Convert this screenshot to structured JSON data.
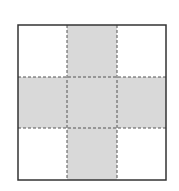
{
  "diagram": {
    "type": "3x3 grid cross pattern",
    "grid": {
      "rows": 3,
      "cols": 3
    },
    "cells": [
      [
        0,
        1,
        0
      ],
      [
        1,
        1,
        1
      ],
      [
        0,
        1,
        0
      ]
    ],
    "colors": {
      "background": "#ffffff",
      "shaded": "#d9d9d9",
      "border": "#333333",
      "dash": "#555555"
    },
    "bounds": {
      "x": 18,
      "y": 25,
      "width": 148,
      "height": 155
    },
    "dividers_x": [
      67,
      117
    ],
    "dividers_y": [
      77,
      128
    ]
  }
}
